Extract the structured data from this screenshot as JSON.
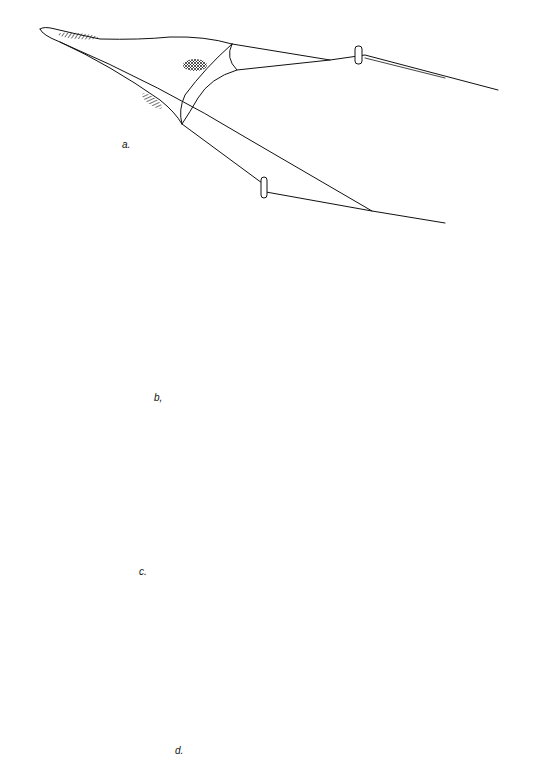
{
  "figure": {
    "background_color": "#ffffff",
    "ink_color": "#111111",
    "panels": [
      {
        "id": "a",
        "label": "a.",
        "label_pos": [
          120,
          145
        ],
        "parts": [
          "net-body",
          "mesh-hatching",
          "headline",
          "footrope",
          "otter-boards",
          "warps"
        ]
      },
      {
        "id": "b",
        "label": "b,",
        "label_pos": [
          155,
          400
        ],
        "parts": [
          "net-body",
          "floats-on-headline",
          "multi-panel-wings",
          "bridles",
          "otter-boards",
          "warps"
        ]
      },
      {
        "id": "c",
        "label": "c.",
        "label_pos": [
          140,
          573
        ],
        "parts": [
          "net-body",
          "mesh-hatching",
          "bridles",
          "otter-boards",
          "warps"
        ]
      },
      {
        "id": "d",
        "label": "d.",
        "label_pos": [
          176,
          752
        ],
        "parts": [
          "net-body",
          "mesh-hatching",
          "floats",
          "beam-frames",
          "warps"
        ]
      }
    ]
  }
}
